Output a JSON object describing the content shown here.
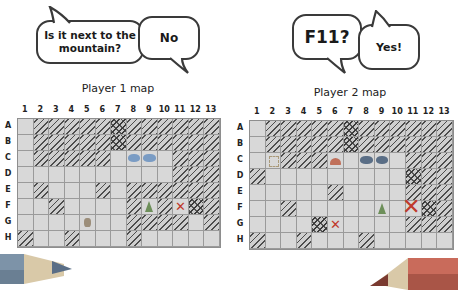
{
  "bubbles": {
    "p1_question": "Is it next to the mountain?",
    "p2_answer": "No",
    "p2_question": "F11?",
    "p1_answer": "Yes!"
  },
  "maps": {
    "player1": {
      "title": "Player 1 map",
      "columns": [
        "1",
        "2",
        "3",
        "4",
        "5",
        "6",
        "7",
        "8",
        "9",
        "10",
        "11",
        "12",
        "13"
      ],
      "rows": [
        "A",
        "B",
        "C",
        "D",
        "E",
        "F",
        "G",
        "H"
      ],
      "cells": {
        "hatched": [
          "A2",
          "A3",
          "A4",
          "A5",
          "A6",
          "A8",
          "A9",
          "A10",
          "A11",
          "A12",
          "A13",
          "B2",
          "B3",
          "B4",
          "B5",
          "B6",
          "B8",
          "B9",
          "B10",
          "B11",
          "B12",
          "B13",
          "C2",
          "C3",
          "C4",
          "C5",
          "C6",
          "C11",
          "C12",
          "C13",
          "D11",
          "D12",
          "D13",
          "E2",
          "E6",
          "E8",
          "E9",
          "E10",
          "E11",
          "E12",
          "E13",
          "F3",
          "F8",
          "F10",
          "F13",
          "G8",
          "G9",
          "G10",
          "G11",
          "G13",
          "H1",
          "H4",
          "H8"
        ],
        "dark_hatched": [
          "A7",
          "B7",
          "F12"
        ],
        "lake": [
          "C8",
          "C9"
        ],
        "mountain": [
          "F9"
        ],
        "rock": [
          "G5"
        ],
        "x_mark": [
          "F11"
        ]
      }
    },
    "player2": {
      "title": "Player 2 map",
      "columns": [
        "1",
        "2",
        "3",
        "4",
        "5",
        "6",
        "7",
        "8",
        "9",
        "10",
        "11",
        "12",
        "13"
      ],
      "rows": [
        "A",
        "B",
        "C",
        "D",
        "E",
        "F",
        "G",
        "H"
      ],
      "cells": {
        "hatched": [
          "A2",
          "A3",
          "A4",
          "A5",
          "A6",
          "A8",
          "A9",
          "A10",
          "A11",
          "A12",
          "A13",
          "B2",
          "B3",
          "B4",
          "B5",
          "B6",
          "B8",
          "B9",
          "B10",
          "B11",
          "B12",
          "B13",
          "C3",
          "C4",
          "C5",
          "C11",
          "C12",
          "C13",
          "D1",
          "D12",
          "D13",
          "E6",
          "E11",
          "E12",
          "E13",
          "F3",
          "F13",
          "G11",
          "G12",
          "G13",
          "H1",
          "H4",
          "H8"
        ],
        "dark_hatched": [
          "A7",
          "B7",
          "D11",
          "F12",
          "G5"
        ],
        "lake": [
          "C8",
          "C9"
        ],
        "mountain": [
          "F9"
        ],
        "hill": [
          "C6"
        ],
        "sketch": [
          "C2"
        ],
        "x_mark": [
          "G6"
        ],
        "big_x_mark": [
          "F11"
        ]
      }
    }
  },
  "colors": {
    "lake": "#7a9cc4",
    "lake_dark": "#5a6e86",
    "mountain": "#6d8f5a",
    "hill": "#c0705a",
    "rock": "#9c8e7a",
    "x_mark": "#c0392b",
    "pencil_left": "#7d93a8",
    "pencil_right": "#c96b5b"
  }
}
